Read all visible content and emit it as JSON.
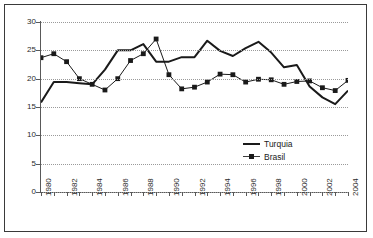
{
  "chart_data": {
    "type": "line",
    "title": "",
    "xlabel": "",
    "ylabel": "",
    "ylim": [
      0,
      30
    ],
    "ytick_step": 5,
    "yticks": [
      0,
      5,
      10,
      15,
      20,
      25,
      30
    ],
    "grid": true,
    "legend_position": "inside-right",
    "x": [
      1980,
      1981,
      1982,
      1983,
      1984,
      1985,
      1986,
      1987,
      1988,
      1989,
      1990,
      1991,
      1992,
      1993,
      1994,
      1995,
      1996,
      1997,
      1998,
      1999,
      2000,
      2001,
      2002,
      2003,
      2004
    ],
    "xtick_labels": [
      "1980",
      "1982",
      "1984",
      "1986",
      "1988",
      "1990",
      "1992",
      "1994",
      "1996",
      "1998",
      "2000",
      "2002",
      "2004"
    ],
    "series": [
      {
        "name": "Turquia",
        "style": "solid-thick",
        "marker": "none",
        "color": "#1a1a1a",
        "values": [
          15.8,
          19.4,
          19.4,
          19.2,
          19.0,
          21.6,
          25.0,
          25.0,
          26.1,
          23.0,
          23.0,
          23.8,
          23.8,
          26.7,
          24.9,
          24.0,
          25.4,
          26.5,
          24.6,
          22.0,
          22.4,
          18.6,
          16.7,
          15.5,
          17.9
        ]
      },
      {
        "name": "Brasil",
        "style": "solid-thin",
        "marker": "square",
        "color": "#1a1a1a",
        "values": [
          23.7,
          24.4,
          23.0,
          20.0,
          19.0,
          18.0,
          20.0,
          23.2,
          24.4,
          27.0,
          20.7,
          18.2,
          18.5,
          19.4,
          20.8,
          20.7,
          19.4,
          19.9,
          19.8,
          19.0,
          19.5,
          19.6,
          18.4,
          17.9,
          19.7
        ]
      }
    ],
    "legend": [
      {
        "label": "Turquia",
        "key": "line"
      },
      {
        "label": "Brasil",
        "key": "line-square"
      }
    ]
  }
}
